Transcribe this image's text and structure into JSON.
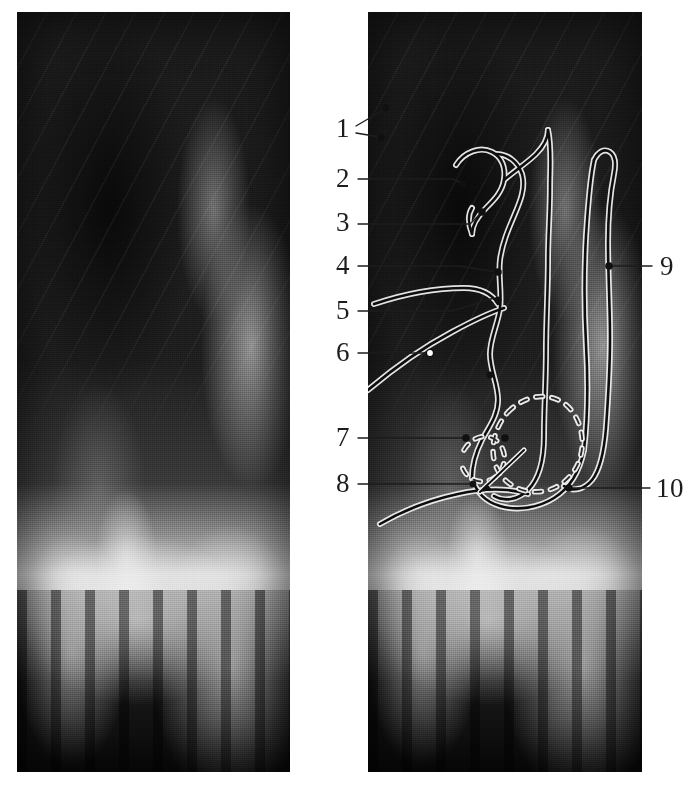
{
  "figure": {
    "type": "paired-lateral-radiograph",
    "panels": [
      {
        "id": "panel-left",
        "name": "plain-radiograph",
        "caption": "",
        "annotated": false,
        "x": 17,
        "y": 12,
        "width": 273,
        "height": 760
      },
      {
        "id": "panel-right",
        "name": "traced-radiograph",
        "caption": "",
        "annotated": true,
        "x": 368,
        "y": 12,
        "width": 274,
        "height": 760
      }
    ]
  },
  "colors": {
    "ink": "#1d1d1d",
    "trace_dark": "#101010",
    "trace_halo": "#f2f2f2",
    "page_background": "#ffffff",
    "film_dark": "#161616",
    "film_light": "#dcdcdc"
  },
  "annotations": {
    "side_left": [
      {
        "number": "1",
        "label_x": 348,
        "label_y": 128,
        "leader": [
          [
            356,
            128
          ],
          [
            385,
            110
          ]
        ],
        "second_leader": [
          [
            356,
            132
          ],
          [
            378,
            136
          ]
        ],
        "marker": [
          385,
          110
        ],
        "marker2": [
          378,
          136
        ],
        "marker_style": "dot"
      },
      {
        "number": "2",
        "label_x": 348,
        "label_y": 178,
        "leader": [
          [
            357,
            179
          ],
          [
            460,
            179
          ]
        ],
        "marker": [
          460,
          179
        ],
        "marker_style": "none"
      },
      {
        "number": "3",
        "label_x": 348,
        "label_y": 222,
        "leader": [
          [
            357,
            224
          ],
          [
            478,
            211
          ]
        ],
        "marker": [
          478,
          211
        ],
        "marker_style": "dot"
      },
      {
        "number": "4",
        "label_x": 348,
        "label_y": 265,
        "leader": [
          [
            357,
            266
          ],
          [
            495,
            270
          ]
        ],
        "marker": [
          495,
          270
        ],
        "marker_style": "dot"
      },
      {
        "number": "5",
        "label_x": 348,
        "label_y": 310,
        "leader": [
          [
            357,
            311
          ],
          [
            492,
            297
          ]
        ],
        "marker": [
          492,
          297
        ],
        "marker_style": "none"
      },
      {
        "number": "6",
        "label_x": 348,
        "label_y": 352,
        "leader": [
          [
            357,
            353
          ],
          [
            432,
            353
          ]
        ],
        "marker": [
          432,
          353
        ],
        "marker_style": "ring"
      },
      {
        "number": "7",
        "label_x": 348,
        "label_y": 437,
        "leader": [
          [
            357,
            438
          ],
          [
            467,
            438
          ]
        ],
        "marker": [
          467,
          438
        ],
        "marker_style": "dot"
      },
      {
        "number": "8",
        "label_x": 348,
        "label_y": 483,
        "leader": [
          [
            357,
            484
          ],
          [
            474,
            484
          ]
        ],
        "marker": [
          474,
          484
        ],
        "marker_style": "dot"
      }
    ],
    "side_right": [
      {
        "number": "9",
        "label_x": 662,
        "label_y": 266,
        "leader": [
          [
            652,
            266
          ],
          [
            608,
            266
          ]
        ],
        "marker": [
          608,
          266
        ],
        "marker_style": "dot"
      },
      {
        "number": "10",
        "label_x": 660,
        "label_y": 488,
        "leader": [
          [
            650,
            488
          ],
          [
            568,
            488
          ]
        ],
        "marker": [
          568,
          488
        ],
        "marker_style": "dot"
      }
    ]
  },
  "tracing": {
    "description": "overlay tracing of soft-tissue and bony landmarks",
    "features": [
      "nasopharyngeal-outline",
      "soft-palate-outline",
      "adenoid-contour",
      "tongue-dorsum-line",
      "airway-column",
      "cervical-vertebrae-column",
      "dashed-oval-region"
    ]
  }
}
